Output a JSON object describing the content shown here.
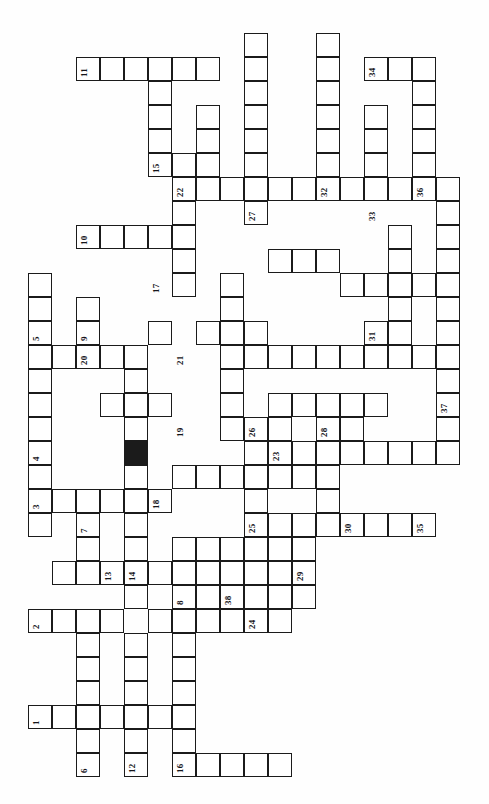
{
  "puzzle": {
    "title": "Crossword Grid",
    "orientation": "rotated-90-ccw",
    "cell_size": 24,
    "origin_x": 28,
    "origin_y": 33,
    "columns": 19,
    "rows": 32,
    "ink_color": "#1b1b1b",
    "block_color": "#1b1b1b",
    "paper_color": "#ffffff",
    "caption": "",
    "blocks": [
      {
        "col": 4,
        "row": 17
      }
    ],
    "cells": [
      {
        "col": 2,
        "row": 1
      },
      {
        "col": 3,
        "row": 1
      },
      {
        "col": 4,
        "row": 1
      },
      {
        "col": 5,
        "row": 1
      },
      {
        "col": 6,
        "row": 1
      },
      {
        "col": 7,
        "row": 1
      },
      {
        "col": 9,
        "row": 0
      },
      {
        "col": 9,
        "row": 1
      },
      {
        "col": 9,
        "row": 2
      },
      {
        "col": 9,
        "row": 3
      },
      {
        "col": 9,
        "row": 4
      },
      {
        "col": 9,
        "row": 5
      },
      {
        "col": 9,
        "row": 6
      },
      {
        "col": 9,
        "row": 7
      },
      {
        "col": 12,
        "row": 0
      },
      {
        "col": 12,
        "row": 1
      },
      {
        "col": 12,
        "row": 2
      },
      {
        "col": 12,
        "row": 3
      },
      {
        "col": 12,
        "row": 4
      },
      {
        "col": 12,
        "row": 5
      },
      {
        "col": 12,
        "row": 6
      },
      {
        "col": 14,
        "row": 1
      },
      {
        "col": 15,
        "row": 1
      },
      {
        "col": 16,
        "row": 1
      },
      {
        "col": 16,
        "row": 2
      },
      {
        "col": 16,
        "row": 3
      },
      {
        "col": 16,
        "row": 4
      },
      {
        "col": 16,
        "row": 5
      },
      {
        "col": 16,
        "row": 6
      },
      {
        "col": 5,
        "row": 2
      },
      {
        "col": 5,
        "row": 3
      },
      {
        "col": 5,
        "row": 4
      },
      {
        "col": 5,
        "row": 5
      },
      {
        "col": 7,
        "row": 3
      },
      {
        "col": 7,
        "row": 4
      },
      {
        "col": 7,
        "row": 5
      },
      {
        "col": 14,
        "row": 3
      },
      {
        "col": 14,
        "row": 4
      },
      {
        "col": 14,
        "row": 5
      },
      {
        "col": 14,
        "row": 6
      },
      {
        "col": 6,
        "row": 6
      },
      {
        "col": 7,
        "row": 6
      },
      {
        "col": 8,
        "row": 6
      },
      {
        "col": 10,
        "row": 6
      },
      {
        "col": 11,
        "row": 6
      },
      {
        "col": 13,
        "row": 6
      },
      {
        "col": 15,
        "row": 6
      },
      {
        "col": 17,
        "row": 6
      },
      {
        "col": 6,
        "row": 5
      },
      {
        "col": 6,
        "row": 7
      },
      {
        "col": 6,
        "row": 8
      },
      {
        "col": 6,
        "row": 9
      },
      {
        "col": 6,
        "row": 10
      },
      {
        "col": 17,
        "row": 7
      },
      {
        "col": 17,
        "row": 8
      },
      {
        "col": 17,
        "row": 9
      },
      {
        "col": 17,
        "row": 10
      },
      {
        "col": 17,
        "row": 11
      },
      {
        "col": 17,
        "row": 12
      },
      {
        "col": 17,
        "row": 13
      },
      {
        "col": 17,
        "row": 14
      },
      {
        "col": 17,
        "row": 15
      },
      {
        "col": 17,
        "row": 16
      },
      {
        "col": 17,
        "row": 17
      },
      {
        "col": 2,
        "row": 8
      },
      {
        "col": 3,
        "row": 8
      },
      {
        "col": 4,
        "row": 8
      },
      {
        "col": 5,
        "row": 8
      },
      {
        "col": 0,
        "row": 10
      },
      {
        "col": 0,
        "row": 11
      },
      {
        "col": 0,
        "row": 12
      },
      {
        "col": 0,
        "row": 13
      },
      {
        "col": 0,
        "row": 14
      },
      {
        "col": 0,
        "row": 15
      },
      {
        "col": 0,
        "row": 16
      },
      {
        "col": 0,
        "row": 17
      },
      {
        "col": 0,
        "row": 18
      },
      {
        "col": 0,
        "row": 19
      },
      {
        "col": 0,
        "row": 20
      },
      {
        "col": 2,
        "row": 11
      },
      {
        "col": 2,
        "row": 12
      },
      {
        "col": 2,
        "row": 13
      },
      {
        "col": 1,
        "row": 13
      },
      {
        "col": 3,
        "row": 13
      },
      {
        "col": 4,
        "row": 13
      },
      {
        "col": 8,
        "row": 10
      },
      {
        "col": 8,
        "row": 11
      },
      {
        "col": 8,
        "row": 12
      },
      {
        "col": 8,
        "row": 13
      },
      {
        "col": 8,
        "row": 14
      },
      {
        "col": 8,
        "row": 15
      },
      {
        "col": 8,
        "row": 16
      },
      {
        "col": 5,
        "row": 12
      },
      {
        "col": 7,
        "row": 12
      },
      {
        "col": 9,
        "row": 12
      },
      {
        "col": 9,
        "row": 13
      },
      {
        "col": 10,
        "row": 13
      },
      {
        "col": 11,
        "row": 13
      },
      {
        "col": 12,
        "row": 13
      },
      {
        "col": 13,
        "row": 13
      },
      {
        "col": 14,
        "row": 12
      },
      {
        "col": 14,
        "row": 13
      },
      {
        "col": 15,
        "row": 13
      },
      {
        "col": 16,
        "row": 13
      },
      {
        "col": 4,
        "row": 14
      },
      {
        "col": 4,
        "row": 15
      },
      {
        "col": 4,
        "row": 16
      },
      {
        "col": 3,
        "row": 15
      },
      {
        "col": 5,
        "row": 15
      },
      {
        "col": 10,
        "row": 15
      },
      {
        "col": 11,
        "row": 15
      },
      {
        "col": 12,
        "row": 15
      },
      {
        "col": 13,
        "row": 15
      },
      {
        "col": 14,
        "row": 15
      },
      {
        "col": 4,
        "row": 18
      },
      {
        "col": 4,
        "row": 19
      },
      {
        "col": 4,
        "row": 20
      },
      {
        "col": 4,
        "row": 21
      },
      {
        "col": 4,
        "row": 22
      },
      {
        "col": 4,
        "row": 23
      },
      {
        "col": 1,
        "row": 19
      },
      {
        "col": 2,
        "row": 19
      },
      {
        "col": 3,
        "row": 19
      },
      {
        "col": 5,
        "row": 19
      },
      {
        "col": 2,
        "row": 20
      },
      {
        "col": 2,
        "row": 21
      },
      {
        "col": 6,
        "row": 18
      },
      {
        "col": 7,
        "row": 18
      },
      {
        "col": 8,
        "row": 18
      },
      {
        "col": 9,
        "row": 18
      },
      {
        "col": 10,
        "row": 18
      },
      {
        "col": 11,
        "row": 18
      },
      {
        "col": 12,
        "row": 16
      },
      {
        "col": 12,
        "row": 17
      },
      {
        "col": 12,
        "row": 18
      },
      {
        "col": 12,
        "row": 19
      },
      {
        "col": 9,
        "row": 20
      },
      {
        "col": 10,
        "row": 20
      },
      {
        "col": 11,
        "row": 20
      },
      {
        "col": 12,
        "row": 20
      },
      {
        "col": 13,
        "row": 20
      },
      {
        "col": 14,
        "row": 20
      },
      {
        "col": 15,
        "row": 20
      },
      {
        "col": 16,
        "row": 20
      },
      {
        "col": 6,
        "row": 21
      },
      {
        "col": 7,
        "row": 21
      },
      {
        "col": 8,
        "row": 21
      },
      {
        "col": 9,
        "row": 21
      },
      {
        "col": 1,
        "row": 22
      },
      {
        "col": 2,
        "row": 22
      },
      {
        "col": 3,
        "row": 22
      },
      {
        "col": 5,
        "row": 22
      },
      {
        "col": 6,
        "row": 22
      },
      {
        "col": 7,
        "row": 22
      },
      {
        "col": 8,
        "row": 22
      },
      {
        "col": 9,
        "row": 22
      },
      {
        "col": 10,
        "row": 22
      },
      {
        "col": 10,
        "row": 21
      },
      {
        "col": 11,
        "row": 21
      },
      {
        "col": 6,
        "row": 23
      },
      {
        "col": 7,
        "row": 23
      },
      {
        "col": 8,
        "row": 23
      },
      {
        "col": 9,
        "row": 23
      },
      {
        "col": 10,
        "row": 23
      },
      {
        "col": 11,
        "row": 22
      },
      {
        "col": 11,
        "row": 23
      },
      {
        "col": 5,
        "row": 24
      },
      {
        "col": 6,
        "row": 24
      },
      {
        "col": 7,
        "row": 24
      },
      {
        "col": 8,
        "row": 24
      },
      {
        "col": 9,
        "row": 24
      },
      {
        "col": 10,
        "row": 24
      },
      {
        "col": 0,
        "row": 24
      },
      {
        "col": 1,
        "row": 24
      },
      {
        "col": 2,
        "row": 24
      },
      {
        "col": 3,
        "row": 24
      },
      {
        "col": 2,
        "row": 25
      },
      {
        "col": 2,
        "row": 26
      },
      {
        "col": 2,
        "row": 27
      },
      {
        "col": 4,
        "row": 25
      },
      {
        "col": 4,
        "row": 26
      },
      {
        "col": 4,
        "row": 27
      },
      {
        "col": 6,
        "row": 25
      },
      {
        "col": 6,
        "row": 26
      },
      {
        "col": 6,
        "row": 27
      },
      {
        "col": 0,
        "row": 28
      },
      {
        "col": 1,
        "row": 28
      },
      {
        "col": 2,
        "row": 28
      },
      {
        "col": 3,
        "row": 28
      },
      {
        "col": 4,
        "row": 28
      },
      {
        "col": 5,
        "row": 28
      },
      {
        "col": 6,
        "row": 28
      },
      {
        "col": 2,
        "row": 29
      },
      {
        "col": 4,
        "row": 29
      },
      {
        "col": 6,
        "row": 29
      },
      {
        "col": 2,
        "row": 30
      },
      {
        "col": 4,
        "row": 30
      },
      {
        "col": 6,
        "row": 30
      },
      {
        "col": 7,
        "row": 30
      },
      {
        "col": 8,
        "row": 30
      },
      {
        "col": 9,
        "row": 30
      },
      {
        "col": 10,
        "row": 30
      },
      {
        "col": 13,
        "row": 16
      },
      {
        "col": 13,
        "row": 17
      },
      {
        "col": 10,
        "row": 16
      },
      {
        "col": 10,
        "row": 17
      },
      {
        "col": 15,
        "row": 8
      },
      {
        "col": 15,
        "row": 9
      },
      {
        "col": 15,
        "row": 10
      },
      {
        "col": 15,
        "row": 11
      },
      {
        "col": 15,
        "row": 12
      },
      {
        "col": 13,
        "row": 10
      },
      {
        "col": 14,
        "row": 10
      },
      {
        "col": 15,
        "row": 10
      },
      {
        "col": 16,
        "row": 10
      },
      {
        "col": 11,
        "row": 9
      },
      {
        "col": 12,
        "row": 9
      },
      {
        "col": 10,
        "row": 9
      },
      {
        "col": 16,
        "row": 17
      },
      {
        "col": 15,
        "row": 17
      },
      {
        "col": 14,
        "row": 17
      },
      {
        "col": 11,
        "row": 17
      },
      {
        "col": 9,
        "row": 19
      },
      {
        "col": 9,
        "row": 16
      },
      {
        "col": 9,
        "row": 17
      }
    ],
    "numbers": [
      {
        "label": "11",
        "col": 2,
        "row": 1
      },
      {
        "label": "15",
        "col": 5,
        "row": 5
      },
      {
        "label": "22",
        "col": 6,
        "row": 6
      },
      {
        "label": "27",
        "col": 9,
        "row": 7
      },
      {
        "label": "32",
        "col": 12,
        "row": 6
      },
      {
        "label": "34",
        "col": 14,
        "row": 1
      },
      {
        "label": "33",
        "col": 14,
        "row": 7
      },
      {
        "label": "36",
        "col": 16,
        "row": 6
      },
      {
        "label": "10",
        "col": 2,
        "row": 8
      },
      {
        "label": "17",
        "col": 5,
        "row": 10
      },
      {
        "label": "5",
        "col": 0,
        "row": 12
      },
      {
        "label": "9",
        "col": 2,
        "row": 12
      },
      {
        "label": "21",
        "col": 6,
        "row": 13
      },
      {
        "label": "31",
        "col": 14,
        "row": 12
      },
      {
        "label": "37",
        "col": 17,
        "row": 15
      },
      {
        "label": "26",
        "col": 9,
        "row": 16
      },
      {
        "label": "20",
        "col": 2,
        "row": 13
      },
      {
        "label": "4",
        "col": 0,
        "row": 17
      },
      {
        "label": "19",
        "col": 6,
        "row": 16
      },
      {
        "label": "28",
        "col": 12,
        "row": 16
      },
      {
        "label": "23",
        "col": 10,
        "row": 17
      },
      {
        "label": "3",
        "col": 0,
        "row": 19
      },
      {
        "label": "7",
        "col": 2,
        "row": 20
      },
      {
        "label": "18",
        "col": 5,
        "row": 19
      },
      {
        "label": "25",
        "col": 9,
        "row": 20
      },
      {
        "label": "30",
        "col": 13,
        "row": 20
      },
      {
        "label": "35",
        "col": 16,
        "row": 20
      },
      {
        "label": "13",
        "col": 3,
        "row": 22
      },
      {
        "label": "14",
        "col": 4,
        "row": 22
      },
      {
        "label": "8",
        "col": 6,
        "row": 23
      },
      {
        "label": "29",
        "col": 11,
        "row": 22
      },
      {
        "label": "38",
        "col": 8,
        "row": 23
      },
      {
        "label": "24",
        "col": 9,
        "row": 24
      },
      {
        "label": "2",
        "col": 0,
        "row": 24
      },
      {
        "label": "1",
        "col": 0,
        "row": 28
      },
      {
        "label": "6",
        "col": 2,
        "row": 30
      },
      {
        "label": "12",
        "col": 4,
        "row": 30
      },
      {
        "label": "16",
        "col": 6,
        "row": 30
      }
    ]
  }
}
